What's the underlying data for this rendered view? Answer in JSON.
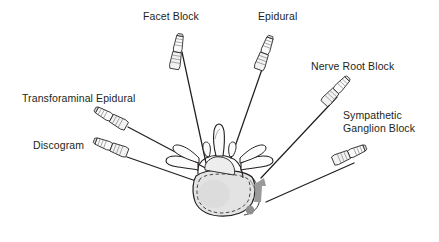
{
  "figure": {
    "view": "axial vertebral cross-section",
    "background_color": "#ffffff",
    "ink_color": "#231f20",
    "body_fill": "#e3e3e3",
    "marker_color": "#9a9a9a"
  },
  "labels": {
    "facet_block": "Facet Block",
    "epidural": "Epidural",
    "nerve_root_block": "Nerve Root Block",
    "sympathetic_line1": "Sympathetic",
    "sympathetic_line2": "Ganglion Block",
    "transforaminal_epidural": "Transforaminal Epidural",
    "discogram": "Discogram"
  },
  "needles": [
    {
      "name": "facet-block-needle",
      "label": "Facet Block",
      "hub_x": 180,
      "hub_y": 36,
      "tip_x": 206,
      "tip_y": 163,
      "angle": 12
    },
    {
      "name": "epidural-needle",
      "label": "Epidural",
      "hub_x": 270,
      "hub_y": 38,
      "tip_x": 231,
      "tip_y": 158,
      "angle": -18
    },
    {
      "name": "nerve-root-block-needle",
      "label": "Nerve Root Block",
      "hub_x": 345,
      "hub_y": 80,
      "tip_x": 261,
      "tip_y": 178,
      "angle": -41
    },
    {
      "name": "sympathetic-ganglion-block-needle",
      "label": "Sympathetic Ganglion Block",
      "hub_x": 360,
      "hub_y": 150,
      "tip_x": 266,
      "tip_y": 202,
      "angle": -29
    },
    {
      "name": "transforaminal-epidural-needle",
      "label": "Transforaminal Epidural",
      "hub_x": 101,
      "hub_y": 112,
      "tip_x": 212,
      "tip_y": 172,
      "angle": 28
    },
    {
      "name": "discogram-needle",
      "label": "Discogram",
      "hub_x": 100,
      "hub_y": 144,
      "tip_x": 218,
      "tip_y": 188,
      "angle": 21
    }
  ],
  "anatomy": {
    "spinous_process": "spinous-process",
    "transverse_process_left": "left-transverse-process",
    "transverse_process_right": "right-transverse-process",
    "vertebral_body": "vertebral-body",
    "lamina": "lamina",
    "target_arrow": "gray-target-arrow",
    "target_dot": "gray-target-dot"
  }
}
